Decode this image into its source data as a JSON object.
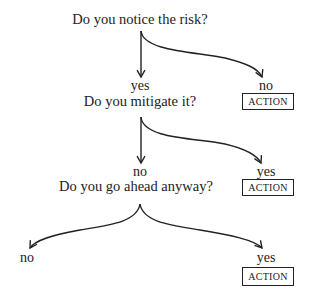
{
  "diagram": {
    "type": "decision-tree",
    "nodes": {
      "q1": {
        "label": "Do you notice the risk?"
      },
      "q1_yes": {
        "label": "yes"
      },
      "q1_no": {
        "label": "no"
      },
      "q1_no_action": {
        "label": "ACTION"
      },
      "q2": {
        "label": "Do you mitigate it?"
      },
      "q2_no": {
        "label": "no"
      },
      "q2_yes": {
        "label": "yes"
      },
      "q2_yes_action": {
        "label": "ACTION"
      },
      "q3": {
        "label": "Do you go ahead anyway?"
      },
      "q3_no": {
        "label": "no"
      },
      "q3_yes": {
        "label": "yes"
      },
      "q3_yes_action": {
        "label": "ACTION"
      }
    },
    "edges": [
      {
        "from": "q1",
        "to": "q1_yes",
        "style": "straight-arrow"
      },
      {
        "from": "q1",
        "to": "q1_no",
        "style": "curved-arrow"
      },
      {
        "from": "q2",
        "to": "q2_no",
        "style": "straight-arrow"
      },
      {
        "from": "q2",
        "to": "q2_yes",
        "style": "curved-arrow"
      },
      {
        "from": "q3",
        "to": "q3_no",
        "style": "curved-arrow"
      },
      {
        "from": "q3",
        "to": "q3_yes",
        "style": "curved-arrow"
      }
    ],
    "colors": {
      "ink": "#222222",
      "background": "#ffffff"
    }
  }
}
